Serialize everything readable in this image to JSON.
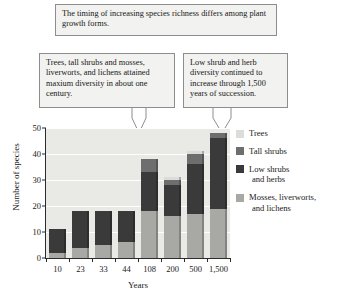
{
  "callouts": {
    "top": "The timing of increasing species richness differs among plant growth forms.",
    "left": "Trees, tall shrubs and mosses, liverworts, and lichens attained maxium diversity in about one century.",
    "right": "Low shrub and herb diversity continued to increase through 1,500 years of succession."
  },
  "legend": {
    "items": [
      {
        "label": "Trees",
        "label2": "",
        "color": "#dcdcd8"
      },
      {
        "label": "Tall shrubs",
        "label2": "",
        "color": "#6e6e6e"
      },
      {
        "label": "Low shrubs",
        "label2": "and herbs",
        "color": "#3a3a3a"
      },
      {
        "label": "Mosses, liverworts,",
        "label2": "and lichens",
        "color": "#a8a8a4"
      }
    ]
  },
  "chart_data": {
    "type": "bar",
    "stacked": true,
    "title": "",
    "xlabel": "Years",
    "ylabel": "Number of species",
    "categories": [
      "10",
      "23",
      "33",
      "44",
      "108",
      "200",
      "500",
      "1,500"
    ],
    "yticks": [
      0,
      10,
      20,
      30,
      40,
      50
    ],
    "ylim": [
      0,
      50
    ],
    "grid": true,
    "legend_position": "right",
    "series": [
      {
        "name": "Mosses, liverworts, and lichens",
        "color": "#a8a8a4",
        "values": [
          2,
          4,
          5,
          6,
          18,
          16,
          17,
          19
        ]
      },
      {
        "name": "Low shrubs and herbs",
        "color": "#3a3a3a",
        "values": [
          9,
          14,
          13,
          12,
          15,
          12,
          19,
          27
        ]
      },
      {
        "name": "Tall shrubs",
        "color": "#6e6e6e",
        "values": [
          0,
          0,
          0,
          0,
          5,
          2,
          4,
          2
        ]
      },
      {
        "name": "Trees",
        "color": "#dcdcd8",
        "values": [
          0,
          0,
          0,
          0,
          0,
          1,
          1,
          0
        ]
      }
    ],
    "totals": [
      11,
      18,
      18,
      18,
      38,
      31,
      41,
      48
    ]
  }
}
